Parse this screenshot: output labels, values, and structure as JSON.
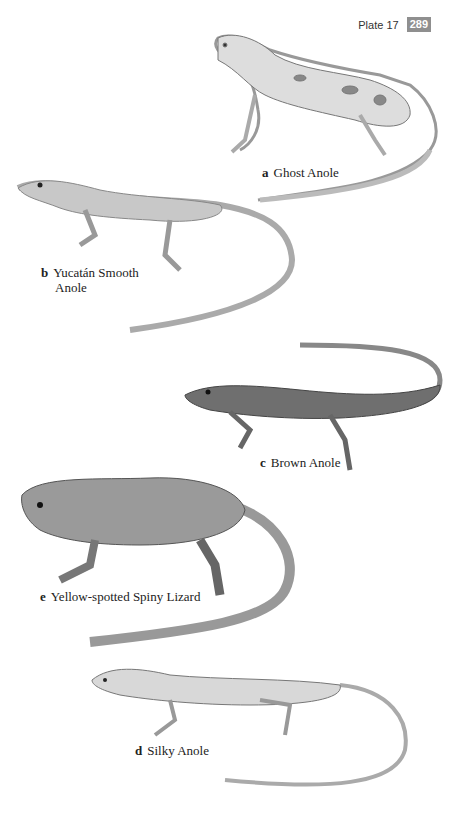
{
  "header": {
    "plate_label": "Plate 17",
    "page_number": "289",
    "page_badge_color": "#8f8f8f"
  },
  "figures": [
    {
      "letter": "a",
      "name": "Ghost Anole"
    },
    {
      "letter": "b",
      "name": "Yucatán Smooth Anole",
      "name_line1": "Yucatán Smooth",
      "name_line2": "Anole"
    },
    {
      "letter": "c",
      "name": "Brown Anole"
    },
    {
      "letter": "e",
      "name": "Yellow-spotted Spiny Lizard"
    },
    {
      "letter": "d",
      "name": "Silky Anole"
    }
  ]
}
